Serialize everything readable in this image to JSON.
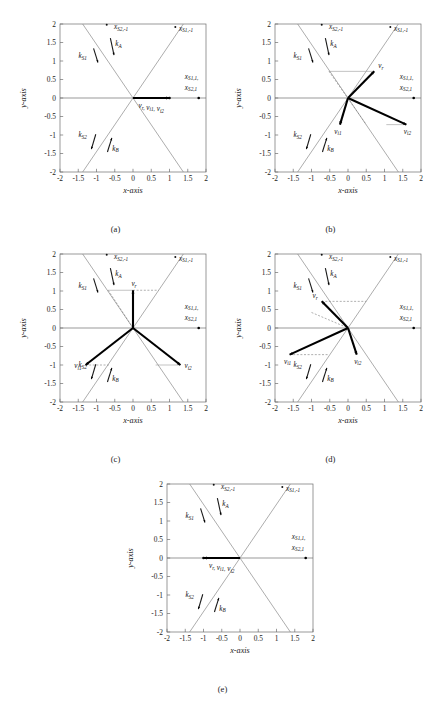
{
  "figure": {
    "axis_labels": {
      "x": "x-axis",
      "y": "y-axis"
    },
    "ticks": [
      "-2",
      "-1.5",
      "-1",
      "-0.5",
      "0",
      "0.5",
      "1",
      "1.5",
      "2"
    ],
    "tick_values": [
      -2,
      -1.5,
      -1,
      -0.5,
      0,
      0.5,
      1,
      1.5,
      2
    ],
    "axis_range": {
      "xmin": -2,
      "xmax": 2,
      "ymin": -2,
      "ymax": 2
    },
    "colors": {
      "vector": "#000000",
      "diagonal": "#8a8a8a",
      "axis": "#6e6e6e",
      "guide": "#9a9a9a",
      "background": "#ffffff"
    },
    "common_labels": {
      "x_s2_m1": {
        "base": "x",
        "sub": "S2,-1"
      },
      "x_s1_m1": {
        "base": "x",
        "sub": "S1,-1"
      },
      "x_s1_p1": {
        "base": "x",
        "sub": "S1,1,"
      },
      "x_s2_p1": {
        "base": "x",
        "sub": "S2,1"
      },
      "k_a": {
        "base": "k",
        "sub": "A"
      },
      "k_b": {
        "base": "k",
        "sub": "B"
      },
      "k_s1": {
        "base": "k",
        "sub": "S1"
      },
      "k_s2": {
        "base": "k",
        "sub": "S2"
      },
      "v_r": {
        "base": "v",
        "sub": "r"
      },
      "v_i1": {
        "base": "v",
        "sub": "i1"
      },
      "v_i2": {
        "base": "v",
        "sub": "i2"
      }
    }
  },
  "chart_data": [
    {
      "type": "scatter",
      "panel": "a",
      "caption": "(a)",
      "title": "",
      "xlabel": "x-axis",
      "ylabel": "y-axis",
      "xlim": [
        -2,
        2
      ],
      "ylim": [
        -2,
        2
      ],
      "grid": false,
      "diagonal_slope": 1.45,
      "vectors": [
        {
          "name": "v_r, v_i1, v_i2",
          "x": 1.0,
          "y": 0.0,
          "label": "v_r, v_i1, v_i2",
          "label_pos": "below"
        }
      ],
      "markers": [
        {
          "x": 1.0,
          "y": 0.0
        },
        {
          "x": 1.8,
          "y": 0.0
        }
      ],
      "combined_vector_label": true,
      "guides": []
    },
    {
      "type": "scatter",
      "panel": "b",
      "caption": "(b)",
      "xlabel": "x-axis",
      "ylabel": "y-axis",
      "xlim": [
        -2,
        2
      ],
      "ylim": [
        -2,
        2
      ],
      "grid": false,
      "diagonal_slope": 1.45,
      "vectors": [
        {
          "name": "v_r",
          "x": 0.72,
          "y": 0.72,
          "label": "v_r",
          "label_pos": "above-right"
        },
        {
          "name": "v_i1",
          "x": -0.22,
          "y": -0.72,
          "label": "v_i1",
          "label_pos": "below-left"
        },
        {
          "name": "v_i2",
          "x": 1.6,
          "y": -0.72,
          "label": "v_i2",
          "label_pos": "below-right"
        }
      ],
      "markers": [
        {
          "x": 1.8,
          "y": 0.0
        }
      ],
      "combined_vector_label": false,
      "guides": [
        {
          "type": "hline",
          "y": 0.72,
          "x0": -0.52,
          "x1": 0.72
        },
        {
          "type": "hline",
          "y": -0.72,
          "x0": 1.05,
          "x1": 1.6
        },
        {
          "type": "dashed",
          "x0": -0.52,
          "y0": 0.72,
          "x1": 0.5,
          "y1": -0.72
        }
      ]
    },
    {
      "type": "scatter",
      "panel": "c",
      "caption": "(c)",
      "xlabel": "x-axis",
      "ylabel": "y-axis",
      "xlim": [
        -2,
        2
      ],
      "ylim": [
        -2,
        2
      ],
      "grid": false,
      "diagonal_slope": 1.45,
      "vectors": [
        {
          "name": "v_r",
          "x": 0.0,
          "y": 1.02,
          "label": "v_r",
          "label_pos": "above"
        },
        {
          "name": "v_i1",
          "x": -1.3,
          "y": -1.0,
          "label": "v_i1",
          "label_pos": "left"
        },
        {
          "name": "v_i2",
          "x": 1.3,
          "y": -1.0,
          "label": "v_i2",
          "label_pos": "right"
        }
      ],
      "markers": [
        {
          "x": 1.8,
          "y": 0.0
        }
      ],
      "combined_vector_label": false,
      "guides": [
        {
          "type": "hline",
          "y": 1.02,
          "x0": -0.68,
          "x1": 0.0
        },
        {
          "type": "hline",
          "y": -1.0,
          "x0": 0.62,
          "x1": 1.3
        },
        {
          "type": "dashed",
          "x0": -0.68,
          "y0": 1.02,
          "x1": 0.0,
          "y1": 0.0
        },
        {
          "type": "dashed",
          "x0": 0.0,
          "y0": 1.02,
          "x1": 0.7,
          "y1": 1.02
        },
        {
          "type": "dashed",
          "x0": -1.3,
          "y0": -1.0,
          "x1": -0.66,
          "y1": -1.0
        }
      ]
    },
    {
      "type": "scatter",
      "panel": "d",
      "caption": "(d)",
      "xlabel": "x-axis",
      "ylabel": "y-axis",
      "xlim": [
        -2,
        2
      ],
      "ylim": [
        -2,
        2
      ],
      "grid": false,
      "diagonal_slope": 1.45,
      "vectors": [
        {
          "name": "v_r",
          "x": -0.72,
          "y": 0.72,
          "label": "v_r",
          "label_pos": "above-left"
        },
        {
          "name": "v_i1",
          "x": -1.6,
          "y": -0.72,
          "label": "v_i1",
          "label_pos": "below-left"
        },
        {
          "name": "v_i2",
          "x": 0.24,
          "y": -0.72,
          "label": "v_i2",
          "label_pos": "below-right"
        }
      ],
      "markers": [
        {
          "x": 1.8,
          "y": 0.0
        }
      ],
      "combined_vector_label": false,
      "guides": [
        {
          "type": "dashed",
          "x0": -0.72,
          "y0": 0.72,
          "x1": 0.5,
          "y1": 0.72
        },
        {
          "type": "dashed",
          "x0": -1.6,
          "y0": -0.72,
          "x1": -0.52,
          "y1": -0.72
        },
        {
          "type": "dashed",
          "x0": -1.0,
          "y0": 0.42,
          "x1": 0.0,
          "y1": 0.0
        }
      ]
    },
    {
      "type": "scatter",
      "panel": "e",
      "caption": "(e)",
      "xlabel": "x-axis",
      "ylabel": "y-axis",
      "xlim": [
        -2,
        2
      ],
      "ylim": [
        -2,
        2
      ],
      "grid": false,
      "diagonal_slope": 1.45,
      "vectors": [
        {
          "name": "v_r, v_i1, v_i2",
          "x": -1.0,
          "y": 0.0,
          "label": "v_r, v_i1, v_i2",
          "label_pos": "below"
        }
      ],
      "markers": [
        {
          "x": -1.0,
          "y": 0.0
        },
        {
          "x": 1.8,
          "y": 0.0
        }
      ],
      "combined_vector_label": true,
      "guides": []
    }
  ],
  "annotations": {
    "k_arrows": [
      {
        "name": "k_A",
        "x0": -0.62,
        "y0": 1.62,
        "x1": -0.52,
        "y1": 1.16,
        "label_x": -0.4,
        "label_y": 1.4
      },
      {
        "name": "k_S1",
        "x0": -1.08,
        "y0": 1.34,
        "x1": -0.96,
        "y1": 0.96,
        "label_x": -1.38,
        "label_y": 1.08
      },
      {
        "name": "k_S2",
        "x0": -1.02,
        "y0": -0.98,
        "x1": -1.14,
        "y1": -1.38,
        "label_x": -1.38,
        "label_y": -1.06
      },
      {
        "name": "k_B",
        "x0": -0.7,
        "y0": -1.46,
        "x1": -0.58,
        "y1": -1.08,
        "label_x": -0.48,
        "label_y": -1.42
      }
    ],
    "axis_endpoint_labels": [
      {
        "name": "x_s2_m1",
        "x": -0.52,
        "y": 1.86,
        "anchor": "start"
      },
      {
        "name": "x_s1_m1",
        "x": 1.26,
        "y": 1.82,
        "anchor": "start"
      },
      {
        "name": "x_s1_p1",
        "x": 1.42,
        "y": 0.52,
        "anchor": "start"
      },
      {
        "name": "x_s2_p1",
        "x": 1.42,
        "y": 0.22,
        "anchor": "start"
      }
    ]
  }
}
